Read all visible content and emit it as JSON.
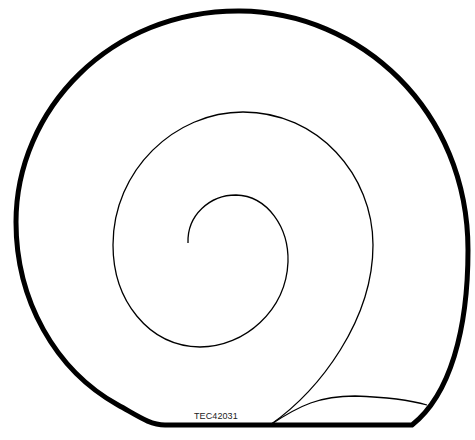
{
  "figure": {
    "reference_code": "TEC42031",
    "colors": {
      "outline": "#000000",
      "background": "#ffffff"
    }
  }
}
